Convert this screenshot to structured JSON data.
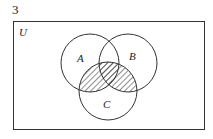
{
  "question_number": "3",
  "diagram": {
    "type": "venn",
    "universal_label": "U",
    "sets": [
      {
        "label": "A",
        "cx": 90,
        "cy": 63,
        "r": 29
      },
      {
        "label": "B",
        "cx": 128,
        "cy": 63,
        "r": 29
      },
      {
        "label": "C",
        "cx": 108,
        "cy": 91,
        "r": 29
      }
    ],
    "shaded_region": "(A ∪ B) ∩ C",
    "line_color": "#333333",
    "hatch_color": "#333333"
  }
}
